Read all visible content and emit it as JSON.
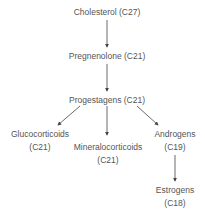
{
  "diagram": {
    "type": "flowchart",
    "title": "",
    "nodes": [
      {
        "id": "cholesterol",
        "line1": "Cholesterol (C27)",
        "line2": ""
      },
      {
        "id": "pregnenolone",
        "line1": "Pregnenolone (C21)",
        "line2": ""
      },
      {
        "id": "progestagens",
        "line1": "Progestagens (C21)",
        "line2": ""
      },
      {
        "id": "glucocorticoids",
        "line1": "Glucocorticoids",
        "line2": "(C21)"
      },
      {
        "id": "mineralocorticoids",
        "line1": "Mineralocorticoids",
        "line2": "(C21)"
      },
      {
        "id": "androgens",
        "line1": "Androgens",
        "line2": "(C19)"
      },
      {
        "id": "estrogens",
        "line1": "Estrogens",
        "line2": "(C18)"
      }
    ],
    "edges": [
      {
        "from": "cholesterol",
        "to": "pregnenolone"
      },
      {
        "from": "pregnenolone",
        "to": "progestagens"
      },
      {
        "from": "progestagens",
        "to": "glucocorticoids"
      },
      {
        "from": "progestagens",
        "to": "mineralocorticoids"
      },
      {
        "from": "progestagens",
        "to": "androgens"
      },
      {
        "from": "androgens",
        "to": "estrogens"
      }
    ],
    "colors": {
      "text": "#555555",
      "arrow": "#444444",
      "background": "#ffffff"
    }
  }
}
